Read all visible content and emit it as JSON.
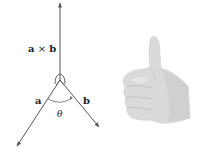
{
  "diagram": {
    "labels": {
      "cross": "a × b",
      "a": "a",
      "b": "b",
      "theta": "θ"
    },
    "vectors": [
      {
        "name": "a × b",
        "from": [
          60,
          80
        ],
        "to": [
          60,
          3
        ]
      },
      {
        "name": "a",
        "from": [
          60,
          80
        ],
        "to": [
          17,
          146
        ]
      },
      {
        "name": "b",
        "from": [
          60,
          80
        ],
        "to": [
          99,
          127
        ]
      }
    ],
    "colors": {
      "line": "#555555",
      "text": "#222222",
      "hand_fill": "#d9d9d9",
      "hand_shade": "#c4c4c4"
    },
    "illustration": "thumbs-up right hand"
  }
}
